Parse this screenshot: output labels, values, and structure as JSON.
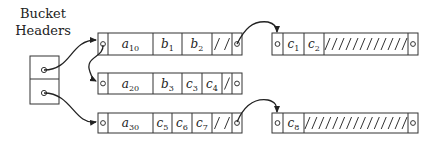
{
  "title": {
    "line1": "Bucket",
    "line2": "Headers"
  },
  "bucket_headers": {
    "x": 30,
    "y": 56,
    "width": 29,
    "height": 48,
    "divider_y": 79,
    "slots": [
      {
        "pointer_cx": 44,
        "pointer_cy": 70,
        "target": "block_a10"
      },
      {
        "pointer_cx": 44,
        "pointer_cy": 93,
        "target": "block_a30"
      }
    ]
  },
  "blocks": [
    {
      "id": "block_a10",
      "x": 98,
      "y": 33,
      "width": 144,
      "height": 22,
      "cells": [
        {
          "kind": "pointer",
          "x0": 98,
          "x1": 108
        },
        {
          "kind": "text",
          "x0": 108,
          "x1": 153,
          "base": "a",
          "sub": "10"
        },
        {
          "kind": "text",
          "x0": 153,
          "x1": 182,
          "base": "b",
          "sub": "1"
        },
        {
          "kind": "text",
          "x0": 182,
          "x1": 212,
          "base": "b",
          "sub": "2"
        },
        {
          "kind": "hatch",
          "x0": 212,
          "x1": 232,
          "slashes": 2
        },
        {
          "kind": "pointer",
          "x0": 232,
          "x1": 242
        }
      ]
    },
    {
      "id": "block_a20",
      "x": 98,
      "y": 73,
      "width": 144,
      "height": 21,
      "cells": [
        {
          "kind": "pointer",
          "x0": 98,
          "x1": 108
        },
        {
          "kind": "text",
          "x0": 108,
          "x1": 153,
          "base": "a",
          "sub": "20"
        },
        {
          "kind": "text",
          "x0": 153,
          "x1": 182,
          "base": "b",
          "sub": "3"
        },
        {
          "kind": "text",
          "x0": 182,
          "x1": 202,
          "base": "c",
          "sub": "3"
        },
        {
          "kind": "text",
          "x0": 202,
          "x1": 222,
          "base": "c",
          "sub": "4"
        },
        {
          "kind": "hatch",
          "x0": 222,
          "x1": 232,
          "slashes": 1
        },
        {
          "kind": "pointer",
          "x0": 232,
          "x1": 242
        }
      ]
    },
    {
      "id": "block_a30",
      "x": 98,
      "y": 113,
      "width": 144,
      "height": 20,
      "cells": [
        {
          "kind": "pointer",
          "x0": 98,
          "x1": 108
        },
        {
          "kind": "text",
          "x0": 108,
          "x1": 153,
          "base": "a",
          "sub": "30"
        },
        {
          "kind": "text",
          "x0": 153,
          "x1": 172,
          "base": "c",
          "sub": "5"
        },
        {
          "kind": "text",
          "x0": 172,
          "x1": 192,
          "base": "c",
          "sub": "6"
        },
        {
          "kind": "text",
          "x0": 192,
          "x1": 212,
          "base": "c",
          "sub": "7"
        },
        {
          "kind": "hatch",
          "x0": 212,
          "x1": 232,
          "slashes": 2
        },
        {
          "kind": "pointer",
          "x0": 232,
          "x1": 242
        }
      ]
    },
    {
      "id": "block_c1",
      "x": 272,
      "y": 33,
      "width": 146,
      "height": 22,
      "cells": [
        {
          "kind": "pointer",
          "x0": 272,
          "x1": 283
        },
        {
          "kind": "text",
          "x0": 283,
          "x1": 304,
          "base": "c",
          "sub": "1"
        },
        {
          "kind": "text",
          "x0": 304,
          "x1": 324,
          "base": "c",
          "sub": "2"
        },
        {
          "kind": "hatch",
          "x0": 324,
          "x1": 408,
          "slashes": 12
        },
        {
          "kind": "pointer",
          "x0": 408,
          "x1": 418
        }
      ]
    },
    {
      "id": "block_c8",
      "x": 272,
      "y": 113,
      "width": 146,
      "height": 20,
      "cells": [
        {
          "kind": "pointer",
          "x0": 272,
          "x1": 283
        },
        {
          "kind": "text",
          "x0": 283,
          "x1": 304,
          "base": "c",
          "sub": "8"
        },
        {
          "kind": "hatch",
          "x0": 304,
          "x1": 408,
          "slashes": 15
        },
        {
          "kind": "pointer",
          "x0": 408,
          "x1": 418
        }
      ]
    }
  ],
  "arrows": [
    {
      "from": "bucket_header_1",
      "to": "block_a10",
      "path": "M44,70 C72,70 70,40 96,40"
    },
    {
      "from": "bucket_header_2",
      "to": "block_a30",
      "path": "M44,93 C72,93 74,125 96,122"
    },
    {
      "from": "block_a10",
      "to": "block_a20",
      "path": "M103,45 C104,58 84,56 90,72 C92,78 94,80 96,81"
    },
    {
      "from": "block_a10",
      "to": "block_c1",
      "path": "M237,44 C244,30 252,20 268,22 C276,24 277,28 277,32"
    },
    {
      "from": "block_a30",
      "to": "block_c8",
      "path": "M237,122 C244,106 254,98 268,100 C276,102 277,106 277,112"
    }
  ],
  "colors": {
    "stroke": "#333333",
    "background": "#ffffff",
    "text": "#222222"
  }
}
